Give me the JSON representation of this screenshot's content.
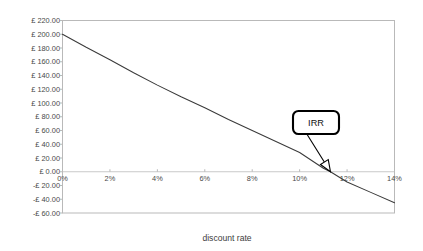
{
  "chart_data": {
    "type": "line",
    "title": "",
    "xlabel": "discount rate",
    "ylabel": "",
    "xlim": [
      0,
      14
    ],
    "ylim": [
      -60,
      220
    ],
    "grid": false,
    "legend": "none",
    "x_tick_labels": [
      "0%",
      "2%",
      "4%",
      "6%",
      "8%",
      "10%",
      "12%",
      "14%"
    ],
    "x_tick_values": [
      0,
      2,
      4,
      6,
      8,
      10,
      12,
      14
    ],
    "y_tick_labels": [
      "£ 220.00",
      "£ 200.00",
      "£ 180.00",
      "£ 160.00",
      "£ 140.00",
      "£ 120.00",
      "£ 100.00",
      "£ 80.00",
      "£ 60.00",
      "£ 40.00",
      "£ 20.00",
      "£ 0.00",
      "-£ 20.00",
      "-£ 40.00",
      "-£ 60.00"
    ],
    "y_tick_values": [
      220,
      200,
      180,
      160,
      140,
      120,
      100,
      80,
      60,
      40,
      20,
      0,
      -20,
      -40,
      -60
    ],
    "series": [
      {
        "name": "NPV",
        "x": [
          0,
          1,
          2,
          3,
          4,
          5,
          6,
          7,
          8,
          9,
          10,
          11,
          11.3,
          12,
          13,
          14
        ],
        "values": [
          200,
          181,
          163,
          144,
          126,
          109,
          93,
          76,
          60,
          44,
          28,
          5,
          0,
          -15,
          -30,
          -45
        ]
      }
    ],
    "annotations": [
      {
        "label": "IRR",
        "type": "callout",
        "target_x": 11.3,
        "target_y": 0
      }
    ],
    "colors": {
      "curve": "#3a3a3a",
      "frame": "#b9b9b9",
      "zero_line": "#c9c9c9",
      "tick_label": "#4a4a4a",
      "callout_border": "#000000",
      "background": "#ffffff"
    }
  }
}
